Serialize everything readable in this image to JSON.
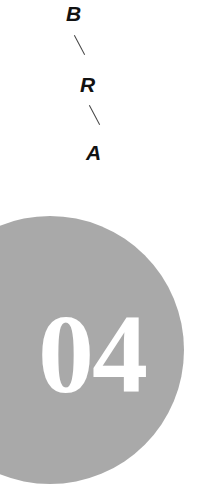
{
  "vertical_word": {
    "letters": [
      "B",
      "R",
      "A"
    ]
  },
  "badge": {
    "number": "04",
    "circle_color": "#a9a9a9",
    "text_color": "#ffffff"
  }
}
